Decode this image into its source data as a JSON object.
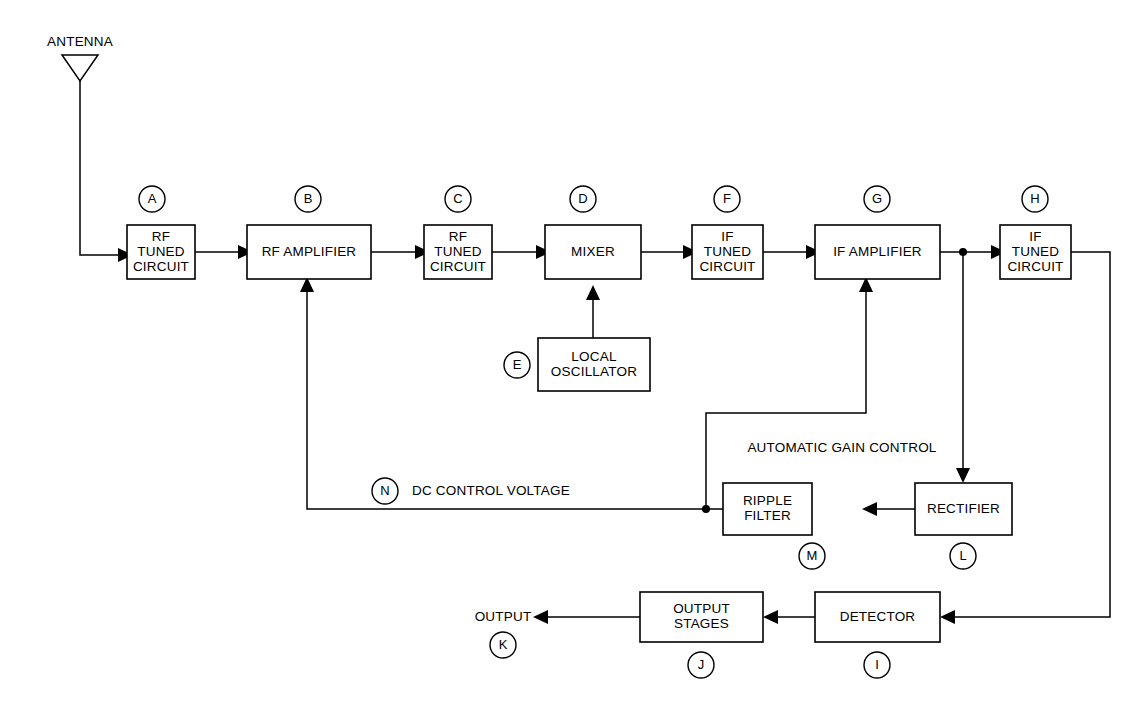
{
  "diagram": {
    "background_color": "#ffffff",
    "line_color": "#000000",
    "blocks": [
      {
        "id": "A",
        "ref": "A",
        "lines": [
          "RF",
          "TUNED",
          "CIRCUIT"
        ],
        "x": 127,
        "y": 225,
        "w": 68,
        "h": 54,
        "ref_cx": 152,
        "ref_cy": 199
      },
      {
        "id": "B",
        "ref": "B",
        "lines": [
          "RF AMPLIFIER"
        ],
        "x": 247,
        "y": 225,
        "w": 124,
        "h": 54,
        "ref_cx": 308,
        "ref_cy": 199
      },
      {
        "id": "C",
        "ref": "C",
        "lines": [
          "RF",
          "TUNED",
          "CIRCUIT"
        ],
        "x": 424,
        "y": 225,
        "w": 68,
        "h": 54,
        "ref_cx": 458,
        "ref_cy": 199
      },
      {
        "id": "D",
        "ref": "D",
        "lines": [
          "MIXER"
        ],
        "x": 545,
        "y": 225,
        "w": 96,
        "h": 54,
        "ref_cx": 583,
        "ref_cy": 199
      },
      {
        "id": "E",
        "ref": "E",
        "lines": [
          "LOCAL",
          "OSCILLATOR"
        ],
        "x": 538,
        "y": 338,
        "w": 112,
        "h": 53,
        "ref_cx": 517,
        "ref_cy": 365
      },
      {
        "id": "F",
        "ref": "F",
        "lines": [
          "IF",
          "TUNED",
          "CIRCUIT"
        ],
        "x": 692,
        "y": 225,
        "w": 71,
        "h": 54,
        "ref_cx": 727,
        "ref_cy": 199
      },
      {
        "id": "G",
        "ref": "G",
        "lines": [
          "IF AMPLIFIER"
        ],
        "x": 815,
        "y": 225,
        "w": 125,
        "h": 54,
        "ref_cx": 877,
        "ref_cy": 199
      },
      {
        "id": "H",
        "ref": "H",
        "lines": [
          "IF",
          "TUNED",
          "CIRCUIT"
        ],
        "x": 1000,
        "y": 225,
        "w": 71,
        "h": 54,
        "ref_cx": 1035,
        "ref_cy": 199
      },
      {
        "id": "L",
        "ref": "L",
        "lines": [
          "RECTIFIER"
        ],
        "x": 915,
        "y": 483,
        "w": 97,
        "h": 52,
        "ref_cx": 963,
        "ref_cy": 556
      },
      {
        "id": "M",
        "ref": "M",
        "lines": [
          "RIPPLE",
          "FILTER"
        ],
        "x": 723,
        "y": 483,
        "w": 89,
        "h": 52,
        "ref_cx": 812,
        "ref_cy": 556
      },
      {
        "id": "I",
        "ref": "I",
        "lines": [
          "DETECTOR"
        ],
        "x": 815,
        "y": 592,
        "w": 125,
        "h": 50,
        "ref_cx": 877,
        "ref_cy": 665
      },
      {
        "id": "J",
        "ref": "J",
        "lines": [
          "OUTPUT",
          "STAGES"
        ],
        "x": 640,
        "y": 592,
        "w": 123,
        "h": 50,
        "ref_cx": 701,
        "ref_cy": 665
      }
    ],
    "free_labels": [
      {
        "name": "antenna-label",
        "text": "ANTENNA",
        "x": 80,
        "y": 42,
        "anchor": "middle"
      },
      {
        "name": "agc-label",
        "text": "AUTOMATIC GAIN CONTROL",
        "x": 842,
        "y": 448,
        "anchor": "middle"
      },
      {
        "name": "dc-control-voltage-label",
        "text": "DC CONTROL VOLTAGE",
        "x": 412,
        "y": 491,
        "anchor": "start"
      },
      {
        "name": "output-label",
        "text": "OUTPUT",
        "x": 503,
        "y": 617,
        "anchor": "middle"
      }
    ],
    "standalone_refs": [
      {
        "id": "N",
        "ref": "N",
        "cx": 385,
        "cy": 491
      },
      {
        "id": "K",
        "ref": "K",
        "cx": 503,
        "cy": 645
      }
    ],
    "signal_paths": [
      {
        "name": "antenna-to-rf-tuned",
        "from": "ANTENNA",
        "to": "A"
      },
      {
        "name": "rf-tuned-to-rf-amplifier",
        "from": "A",
        "to": "B"
      },
      {
        "name": "rf-amplifier-to-rf-tuned-c",
        "from": "B",
        "to": "C"
      },
      {
        "name": "rf-tuned-c-to-mixer",
        "from": "C",
        "to": "D"
      },
      {
        "name": "local-oscillator-to-mixer",
        "from": "E",
        "to": "D"
      },
      {
        "name": "mixer-to-if-tuned-f",
        "from": "D",
        "to": "F"
      },
      {
        "name": "if-tuned-f-to-if-amplifier",
        "from": "F",
        "to": "G"
      },
      {
        "name": "if-amplifier-to-if-tuned-h",
        "from": "G",
        "to": "H"
      },
      {
        "name": "if-tuned-h-to-detector",
        "from": "H",
        "to": "I"
      },
      {
        "name": "detector-to-output-stages",
        "from": "I",
        "to": "J"
      },
      {
        "name": "output-stages-to-output",
        "from": "J",
        "to": "OUTPUT"
      },
      {
        "name": "if-amplifier-tap-to-rectifier",
        "from": "G",
        "to": "L"
      },
      {
        "name": "rectifier-to-ripple-filter",
        "from": "L",
        "to": "M"
      },
      {
        "name": "ripple-filter-to-if-amplifier-agc",
        "from": "M",
        "to": "G"
      },
      {
        "name": "ripple-filter-to-rf-amplifier-agc",
        "from": "M",
        "to": "B"
      }
    ]
  }
}
